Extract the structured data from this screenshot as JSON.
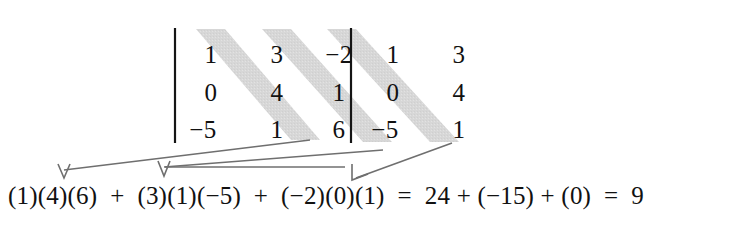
{
  "figure": {
    "kind": "sarrus-rule-determinant-diagram",
    "stripe_color": "#d7d7d7",
    "rule_color": "#151515",
    "arrow_color": "#6f6f6f",
    "text_color": "#111111",
    "background": "#ffffff"
  },
  "matrix": {
    "rows": [
      {
        "main": [
          "1",
          "3",
          "−2"
        ],
        "repeat": [
          "1",
          "3"
        ]
      },
      {
        "main": [
          "0",
          "4",
          "1"
        ],
        "repeat": [
          "0",
          "4"
        ]
      },
      {
        "main": [
          "−5",
          "1",
          "6"
        ],
        "repeat": [
          "−5",
          "1"
        ]
      }
    ],
    "bars": [
      "left-determinant-bar",
      "middle-determinant-bar"
    ],
    "diagonals": [
      {
        "name": "diagonal-1",
        "cells": [
          "1",
          "4",
          "6"
        ],
        "product": "24"
      },
      {
        "name": "diagonal-2",
        "cells": [
          "3",
          "1",
          "−5"
        ],
        "product": "−15"
      },
      {
        "name": "diagonal-3",
        "cells": [
          "−2",
          "0",
          "1"
        ],
        "product": "0"
      }
    ]
  },
  "equation": {
    "terms": [
      "(1)(4)(6)",
      "+",
      "(3)(1)(−5)",
      "+",
      "(−2)(0)(1)",
      "=",
      "24",
      "+",
      "(−15)",
      "+",
      "(0)",
      "=",
      "9"
    ],
    "full_text": "(1)(4)(6)  +  (3)(1)(−5)  +  (−2)(0)(1)  =  24 + (−15) + (0)  =  9",
    "result": "9"
  },
  "arrows": [
    {
      "name": "arrow-to-term-1",
      "from": "diagonal-1-end",
      "to": "term-(1)(4)(6)"
    },
    {
      "name": "arrow-to-term-2",
      "from": "diagonal-2-end",
      "to": "term-(3)(1)(−5)"
    },
    {
      "name": "arrow-to-term-3",
      "from": "diagonal-3-end",
      "to": "term-(−2)(0)(1)"
    }
  ]
}
